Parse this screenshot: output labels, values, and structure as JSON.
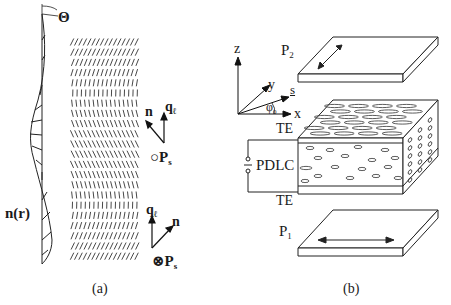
{
  "figure": {
    "panel_a": {
      "caption": "(a)",
      "theta_label": "Θ",
      "director_label": "n(r)",
      "upper_triad": {
        "n_label": "n",
        "q_label": "q",
        "q_sub": "ℓ",
        "ps_symbol": "○",
        "ps_label": "P",
        "ps_sub": "s"
      },
      "lower_triad": {
        "n_label": "n",
        "q_label": "q",
        "q_sub": "ℓ",
        "ps_symbol": "⊗",
        "ps_label": "P",
        "ps_sub": "s"
      },
      "layers": {
        "rows": 22,
        "description": "smectic layer lines with tilt varying along height"
      }
    },
    "panel_b": {
      "caption": "(b)",
      "axes": {
        "z": "z",
        "y": "y",
        "x": "x",
        "s": "s",
        "angle": "φ",
        "angle_sub": "0"
      },
      "polarizer_top": {
        "label": "P",
        "sub": "2",
        "arrow": "diagonal"
      },
      "polarizer_bottom": {
        "label": "P",
        "sub": "1",
        "arrow": "horizontal"
      },
      "electrode_top": "TE",
      "electrode_bottom": "TE",
      "cell_label": "PDLC"
    }
  }
}
